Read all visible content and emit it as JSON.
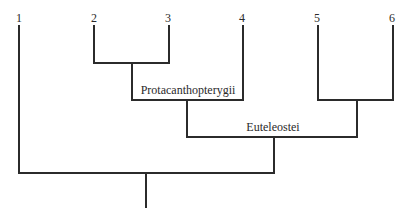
{
  "diagram": {
    "type": "cladogram",
    "taxa": [
      {
        "id": "1",
        "label": "1",
        "x": 18
      },
      {
        "id": "2",
        "label": "2",
        "x": 93
      },
      {
        "id": "3",
        "label": "3",
        "x": 168
      },
      {
        "id": "4",
        "label": "4",
        "x": 242
      },
      {
        "id": "5",
        "label": "5",
        "x": 317
      },
      {
        "id": "6",
        "label": "6",
        "x": 392
      }
    ],
    "clades": [
      {
        "id": "c23",
        "members": [
          "2",
          "3"
        ],
        "label": ""
      },
      {
        "id": "protacanthopterygii",
        "members": [
          "2",
          "3",
          "4"
        ],
        "label": "Protacanthopterygii"
      },
      {
        "id": "c56",
        "members": [
          "5",
          "6"
        ],
        "label": ""
      },
      {
        "id": "euteleostei",
        "members": [
          "2",
          "3",
          "4",
          "5",
          "6"
        ],
        "label": "Euteleostei"
      },
      {
        "id": "root",
        "members": [
          "1",
          "2",
          "3",
          "4",
          "5",
          "6"
        ],
        "label": ""
      }
    ]
  },
  "labels": {
    "tip1": "1",
    "tip2": "2",
    "tip3": "3",
    "tip4": "4",
    "tip5": "5",
    "tip6": "6",
    "protacanthopterygii": "Protacanthopterygii",
    "euteleostei": "Euteleostei"
  },
  "colors": {
    "line": "#2b2b2b",
    "text": "#2a2a2a",
    "background": "#ffffff"
  }
}
